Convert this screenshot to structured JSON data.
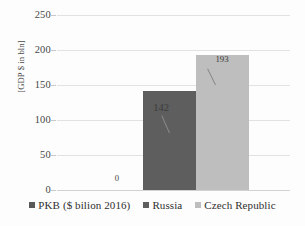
{
  "chart_data": {
    "type": "bar",
    "title": "",
    "xlabel": "",
    "ylabel": "[GDP $ in bln]",
    "ylim": [
      0,
      250
    ],
    "yticks": [
      "0",
      "50",
      "100",
      "150",
      "200",
      "250"
    ],
    "grid": true,
    "legend_position": "bottom",
    "categories": [
      ""
    ],
    "series": [
      {
        "name": "PKB ($ bilion 2016)",
        "values": [
          0
        ],
        "label": "0",
        "color": "#595959"
      },
      {
        "name": "Russia",
        "values": [
          142
        ],
        "label": "142",
        "color": "#5e5e5e"
      },
      {
        "name": "Czech Republic",
        "values": [
          193
        ],
        "label": "193",
        "color": "#bebebe"
      }
    ]
  },
  "axis": {
    "y_title": "[GDP $ in bln]",
    "ticks": {
      "t0": "0",
      "t50": "50",
      "t100": "100",
      "t150": "150",
      "t200": "200",
      "t250": "250"
    }
  },
  "labels": {
    "pkb": "0",
    "russia": "142",
    "czech": "193"
  },
  "legend": {
    "items": [
      {
        "label": "PKB ($ bilion 2016)",
        "color": "#595959"
      },
      {
        "label": "Russia",
        "color": "#5e5e5e"
      },
      {
        "label": "Czech Republic",
        "color": "#bebebe"
      }
    ]
  }
}
